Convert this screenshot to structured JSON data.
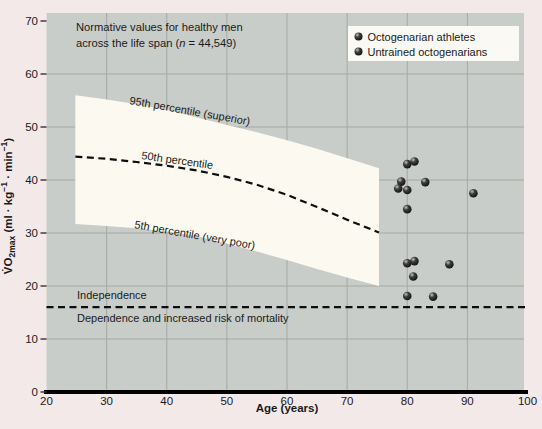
{
  "figure": {
    "colors": {
      "outer_bg": "#f3e9e9",
      "plot_bg": "#c9cdc9",
      "grid": "#a4a9a4",
      "band": "#fcfaf0",
      "legend_bg": "#faf9f3",
      "marker_dark": "#1c1c1c",
      "marker_mid": "#3d3d3d",
      "marker_highlight": "#c2c2c2",
      "line": "#0d0d0d",
      "axis": "#000000"
    },
    "labels": {
      "annotation_line1": "Normative values for healthy men",
      "annotation_line2_segments": [
        {
          "t": "across the life span ("
        },
        {
          "t": "n",
          "italic": true
        },
        {
          "t": " = 44,549)"
        }
      ],
      "band_top": "95th percentile (superior)",
      "band_mid": "50th percentile",
      "band_bottom": "5th percentile (very poor)",
      "independence_above": "Independence",
      "independence_below": "Dependence and increased risk of mortality",
      "xlabel": "Age (years)",
      "ylabel_plain": "VO2max (ml · kg-1 · min-1)",
      "ylabel_segments": [
        {
          "t": "V̇O"
        },
        {
          "t": "2max",
          "sub": true
        },
        {
          "t": " (ml · kg"
        },
        {
          "t": "−1",
          "sup": true
        },
        {
          "t": " · min"
        },
        {
          "t": "−1",
          "sup": true
        },
        {
          "t": ")"
        }
      ]
    },
    "legend": {
      "items": [
        {
          "label": "Octogenarian athletes"
        },
        {
          "label": "Untrained octogenarians"
        }
      ]
    }
  },
  "chart_data": {
    "type": "scatter",
    "title": "Normative values for healthy men across the life span (n = 44,549)",
    "xlabel": "Age (years)",
    "ylabel": "VO2max (ml · kg−1 · min−1)",
    "xlim": [
      20,
      100
    ],
    "ylim": [
      0,
      70
    ],
    "xticks": [
      20,
      30,
      40,
      50,
      60,
      70,
      80,
      90,
      100
    ],
    "yticks": [
      0,
      10,
      20,
      30,
      40,
      50,
      60,
      70
    ],
    "grid_x": [
      30,
      40,
      50,
      60,
      70,
      80,
      90
    ],
    "grid_y": [
      10,
      20,
      30,
      40,
      50,
      60
    ],
    "grid_on": true,
    "legend_position": "top-right",
    "percentile_band": {
      "ages": [
        24.8,
        30,
        35,
        40,
        45,
        50,
        55,
        60,
        65,
        70,
        75.3
      ],
      "p95": [
        56.0,
        55.2,
        54.3,
        53.2,
        51.8,
        50.4,
        49.0,
        47.5,
        45.9,
        44.1,
        42.2
      ],
      "p50": [
        44.4,
        44.0,
        43.4,
        42.7,
        41.8,
        40.6,
        39.1,
        37.2,
        34.9,
        32.5,
        30.1
      ],
      "p5": [
        31.7,
        31.3,
        30.9,
        30.3,
        29.4,
        28.0,
        26.5,
        24.9,
        23.2,
        21.6,
        20.0
      ]
    },
    "independence_threshold_y": 16,
    "series": [
      {
        "name": "Octogenarian athletes",
        "points": [
          [
            80,
            43
          ],
          [
            81.2,
            43.5
          ],
          [
            79,
            39.7
          ],
          [
            83,
            39.6
          ],
          [
            78.5,
            38.4
          ],
          [
            80,
            38.1
          ],
          [
            91,
            37.5
          ],
          [
            80,
            34.5
          ]
        ]
      },
      {
        "name": "Untrained octogenarians",
        "points": [
          [
            80,
            24.3
          ],
          [
            81.2,
            24.7
          ],
          [
            87,
            24.1
          ],
          [
            81,
            21.8
          ],
          [
            80,
            18.1
          ],
          [
            84.3,
            18.0
          ]
        ]
      }
    ]
  }
}
